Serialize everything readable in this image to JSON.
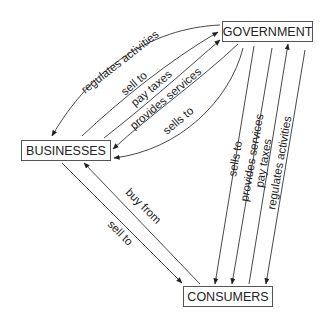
{
  "nodes": {
    "government": "GOVERNMENT",
    "businesses": "BUSINESSES",
    "consumers": "CONSUMERS"
  },
  "edges": {
    "gov_regulates_biz": "regulates activities",
    "biz_sell_to_gov": "sell to",
    "biz_pay_taxes_gov": "pay taxes",
    "gov_provides_services_biz": "provides services",
    "gov_sells_to_biz": "sells to",
    "con_buy_from_biz": "buy from",
    "biz_sell_to_con": "sell to",
    "gov_sells_to_con": "sells to",
    "gov_provides_services_con": "provides services",
    "con_pay_taxes_gov": "pay taxes",
    "gov_regulates_con": "regulates activities"
  },
  "colors": {
    "line": "#333333",
    "box_border": "#555555",
    "text": "#222222"
  }
}
